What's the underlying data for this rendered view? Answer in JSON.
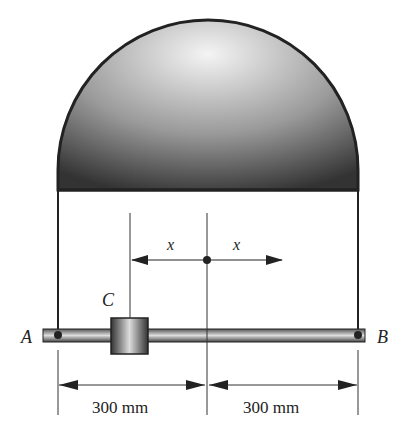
{
  "figure": {
    "points": {
      "A": "A",
      "B": "B",
      "C": "C"
    },
    "variables": {
      "x_left": "x",
      "x_right": "x"
    },
    "dimensions": {
      "left": "300 mm",
      "right": "300 mm"
    }
  },
  "colors": {
    "stroke": "#222222",
    "shade_dark": "#3a3a3a",
    "shade_light": "#f2f2f2"
  }
}
